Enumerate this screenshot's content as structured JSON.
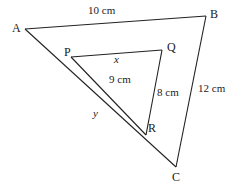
{
  "diagram": {
    "type": "similar-triangles",
    "outer_triangle": {
      "vertices": {
        "A": {
          "label": "A",
          "x": 25,
          "y": 29
        },
        "B": {
          "label": "B",
          "x": 206,
          "y": 16
        },
        "C": {
          "label": "C",
          "x": 176,
          "y": 167
        }
      },
      "sides": {
        "AB": "10 cm",
        "BC": "12 cm",
        "AC": "y"
      }
    },
    "inner_triangle": {
      "vertices": {
        "P": {
          "label": "P",
          "x": 71,
          "y": 57
        },
        "Q": {
          "label": "Q",
          "x": 162,
          "y": 50
        },
        "R": {
          "label": "R",
          "x": 146,
          "y": 135
        }
      },
      "sides": {
        "PQ": "x",
        "QR": "8 cm",
        "PR": "9 cm"
      }
    }
  }
}
